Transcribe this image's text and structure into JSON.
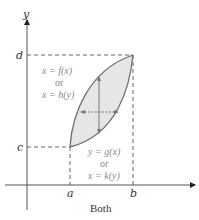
{
  "axes": {
    "x_label": "",
    "y_label": "y",
    "x_ticks": [
      "a",
      "b"
    ],
    "y_ticks": [
      "c",
      "d"
    ]
  },
  "top_curve": {
    "line1": "x = f(x)",
    "line2": "or",
    "line3": "x = h(y)"
  },
  "bottom_curve": {
    "line1": "y = g(x)",
    "line2": "or",
    "line3": "x = k(y)"
  },
  "caption": "Both",
  "colors": {
    "region_fill": "#e6e6e6",
    "curve": "#6e6e6e",
    "axis": "#555555",
    "dashed": "#666666"
  }
}
